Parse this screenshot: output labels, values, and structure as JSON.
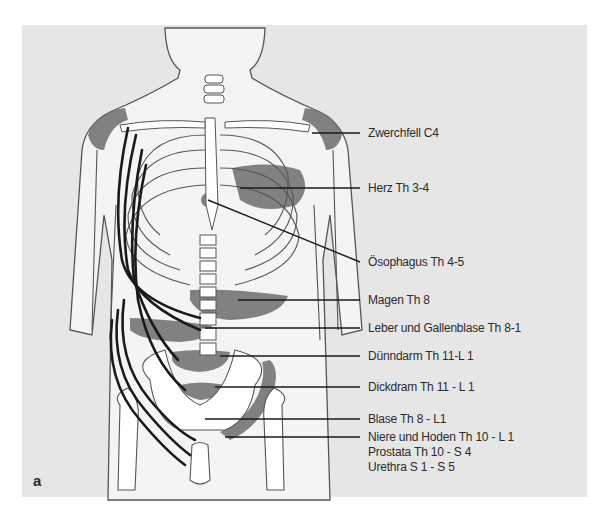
{
  "figure": {
    "panel_letter": "a",
    "colors": {
      "background": "#e6e6e6",
      "body_fill": "#f4f4f4",
      "outline": "#555555",
      "projection_zone": "#6e6e6e",
      "nerve": "#1a1a1a",
      "label_text": "#2b2b2b"
    },
    "labels": [
      {
        "text": "Zwerchfell C4"
      },
      {
        "text": "Herz Th 3-4"
      },
      {
        "text": "Ösophagus Th 4-5"
      },
      {
        "text": "Magen Th 8"
      },
      {
        "text": "Leber und Gallenblase Th 8-1"
      },
      {
        "text": "Dünndarm Th 11-L 1"
      },
      {
        "text": "Dickdram Th 11 - L 1"
      },
      {
        "text": "Blase Th 8 - L1"
      },
      {
        "text": "Niere und Hoden Th 10 - L 1"
      },
      {
        "text": "Prostata Th 10 - S 4"
      },
      {
        "text": "Urethra S 1 - S 5"
      }
    ]
  }
}
